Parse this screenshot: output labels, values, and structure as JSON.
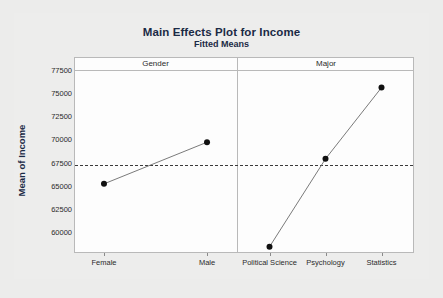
{
  "chart_data": {
    "type": "line",
    "title": "Main Effects Plot for Income",
    "subtitle": "Fitted Means",
    "ylabel": "Mean of Income",
    "xlabel": "",
    "ylim": [
      58000,
      78500
    ],
    "yticks": [
      60000,
      62500,
      65000,
      67500,
      70000,
      72500,
      75000,
      77500
    ],
    "ytick_labels": [
      "60000",
      "62500",
      "65000",
      "67500",
      "70000",
      "72500",
      "75000",
      "77500"
    ],
    "grid": false,
    "legend": "none",
    "reference_line": {
      "value": 67250,
      "style": "dashed",
      "label": "grand mean"
    },
    "panels": [
      {
        "name": "Gender",
        "categories": [
          "Female",
          "Male"
        ],
        "values": [
          65200,
          69700
        ]
      },
      {
        "name": "Major",
        "categories": [
          "Political Science",
          "Psychology",
          "Statistics"
        ],
        "values": [
          58400,
          67900,
          75600
        ]
      }
    ],
    "marker": "filled-circle",
    "colors": {
      "line": "#6b6b6b",
      "marker": "#111111",
      "reference": "#3a3a3a",
      "title": "#1b2a45",
      "frame": "#b9b9b9",
      "plot_bg": "#fdfdfd",
      "page_bg": "#ececeb"
    }
  }
}
